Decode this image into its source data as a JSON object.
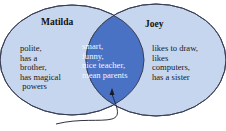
{
  "diagram": {
    "type": "venn",
    "sets": [
      {
        "name": "Matilda",
        "only_traits": [
          "polite,",
          "has a",
          "brother,",
          "has magical",
          " powers"
        ]
      },
      {
        "name": "Joey",
        "only_traits": [
          "likes to draw,",
          "likes",
          "computers,",
          "has a sister"
        ]
      }
    ],
    "intersection": [
      "smart,",
      "funny,",
      "nice teacher,",
      "mean parents"
    ],
    "colors": {
      "circle_fill": "#c6d6ee",
      "overlap_fill": "#4a72c4",
      "outline": "#3a3f55",
      "background": "#ffffff"
    },
    "arrow": {
      "points_to": "intersection"
    }
  },
  "text": {
    "matilda_title": "Matilda",
    "joey_title": "Joey",
    "matilda_body": "polite,\nhas a\nbrother,\nhas magical\n powers",
    "joey_body": "likes to draw,\nlikes\ncomputers,\nhas a sister",
    "both_body": "smart,\nfunny,\nnice teacher,\nmean parents"
  }
}
